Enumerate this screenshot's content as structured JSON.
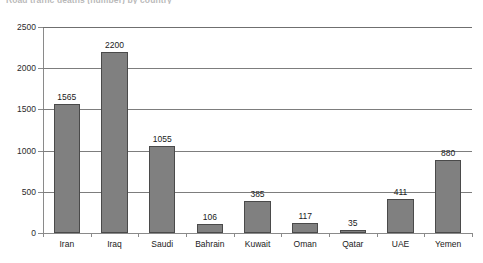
{
  "chart_data": {
    "type": "bar",
    "title": "Road traffic deaths (number) by country",
    "xlabel": "",
    "ylabel": "",
    "ylim": [
      0,
      2500
    ],
    "ytick_step": 500,
    "yticks": [
      0,
      500,
      1000,
      1500,
      2000,
      2500
    ],
    "ytick_labels": [
      "0",
      "500",
      "1000",
      "1500",
      "2000",
      "2500"
    ],
    "grid": true,
    "legend": "none",
    "categories": [
      "Iran",
      "Iraq",
      "Saudi",
      "Bahrain",
      "Kuwait",
      "Oman",
      "Qatar",
      "UAE",
      "Yemen"
    ],
    "values": [
      1565,
      2200,
      1055,
      106,
      385,
      117,
      35,
      411,
      880
    ],
    "data_labels": [
      "1565",
      "2200",
      "1055",
      "106",
      "385",
      "117",
      "35",
      "411",
      "880"
    ],
    "bar_color": "#808080",
    "bar_border_color": "#4a4a4a",
    "gridline_color": "#7d7d7d",
    "axis_color": "#8a8a8a"
  }
}
